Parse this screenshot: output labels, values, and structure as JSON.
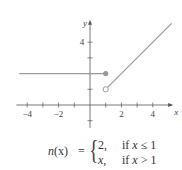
{
  "chart_data": {
    "type": "line",
    "title": "",
    "xlabel": "x",
    "ylabel": "y",
    "xlim": [
      -4.5,
      5.3
    ],
    "ylim": [
      -1.2,
      5.3
    ],
    "grid": false,
    "x_ticks": [
      -4,
      -3,
      -2,
      -1,
      1,
      2,
      3,
      4
    ],
    "x_tick_labels": [
      "-4",
      "-2",
      "2",
      "4"
    ],
    "x_tick_label_values": [
      -4,
      -2,
      2,
      4
    ],
    "y_ticks": [
      -1,
      1,
      2,
      3,
      4
    ],
    "y_tick_labels": [
      "4"
    ],
    "y_tick_label_values": [
      4
    ],
    "series": [
      {
        "name": "n(x) = 2, x ≤ 1",
        "x": [
          -4.5,
          1
        ],
        "y": [
          2,
          2
        ],
        "endpoint": {
          "x": 1,
          "y": 2,
          "style": "filled"
        }
      },
      {
        "name": "n(x) = x, x > 1",
        "x": [
          1,
          5.2
        ],
        "y": [
          1,
          5.2
        ],
        "endpoint": {
          "x": 1,
          "y": 1,
          "style": "open"
        }
      }
    ],
    "colors": {
      "curve": "#9a9a9a",
      "axis": "#555555",
      "text": "#444444"
    },
    "annotation": "piecewise function n(x)"
  },
  "equation": {
    "lhs_fn": "n",
    "lhs_arg": "(x)",
    "equals": "=",
    "cases": [
      {
        "value": "2,",
        "condition_text": "if ",
        "condition_var": "x",
        "condition_rest": " ≤ 1"
      },
      {
        "value": "x,",
        "condition_text": "if ",
        "condition_var": "x",
        "condition_rest": " > 1"
      }
    ]
  }
}
